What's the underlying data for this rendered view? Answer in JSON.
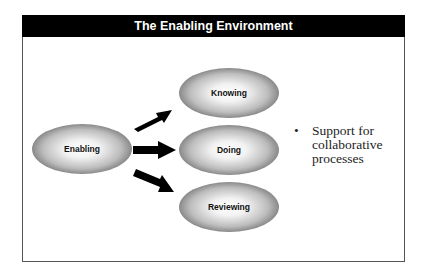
{
  "title": "The Enabling Environment",
  "diagram": {
    "source_node": {
      "label": "Enabling"
    },
    "target_nodes": [
      {
        "label": "Knowing"
      },
      {
        "label": "Doing"
      },
      {
        "label": "Reviewing"
      }
    ],
    "edges": [
      {
        "from": "Enabling",
        "to": "Knowing"
      },
      {
        "from": "Enabling",
        "to": "Doing"
      },
      {
        "from": "Enabling",
        "to": "Reviewing"
      }
    ]
  },
  "bullets": [
    {
      "marker": "•",
      "text": "Support for collaborative processes"
    }
  ]
}
